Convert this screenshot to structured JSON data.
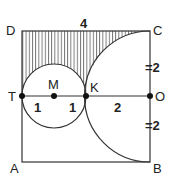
{
  "diagram": {
    "type": "geometry",
    "points": {
      "D": "D",
      "C": "C",
      "A": "A",
      "B": "B",
      "T": "T",
      "M": "M",
      "K": "K",
      "O": "O"
    },
    "lengths": {
      "top_side": "4",
      "TM": "1",
      "MK": "1",
      "KO": "2",
      "CO": "=2",
      "OB": "=2"
    },
    "shapes": [
      "square ABCD with side 4",
      "circle centered at M with radius 1 through T and K",
      "semicircle centered at O with radius 2 from C to B through K",
      "hatched region between DC, arc of semicircle, and upper arc of circle M"
    ]
  }
}
